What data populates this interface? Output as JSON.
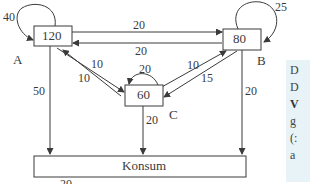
{
  "nodes": [
    {
      "id": "A",
      "label": "A",
      "value": "120"
    },
    {
      "id": "B",
      "label": "B",
      "value": "80"
    },
    {
      "id": "C",
      "label": "C",
      "value": "60"
    },
    {
      "id": "Konsum",
      "label": "Konsum"
    }
  ],
  "edges": {
    "A_self": "40",
    "A_to_B": "20",
    "B_to_A": "20",
    "A_to_C": "10",
    "C_to_A": "10",
    "C_self": "20",
    "C_to_B": "10",
    "B_to_C": "15",
    "A_to_Konsum": "50",
    "C_to_Konsum": "20",
    "B_self": "25",
    "B_to_Konsum": "20",
    "bottom_partial": "20"
  },
  "side_panel": {
    "lines": [
      "D",
      "D",
      "V",
      "g",
      "(:",
      "a"
    ]
  },
  "colors": {
    "line": "#3a3a3a",
    "panel": "#e8f3f7"
  }
}
